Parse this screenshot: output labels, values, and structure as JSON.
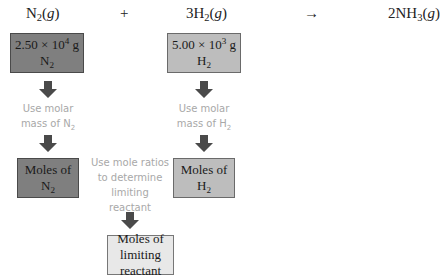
{
  "equation": {
    "reactant1": {
      "coef": "",
      "formula": "N",
      "sub": "2",
      "state": "g"
    },
    "plus": "+",
    "reactant2": {
      "coef": "3",
      "formula": "H",
      "sub": "2",
      "state": "g"
    },
    "arrow": "→",
    "product": {
      "coef": "2",
      "formula": "NH",
      "sub": "3",
      "state": "g"
    }
  },
  "boxes": {
    "n2_mass": {
      "mantissa": "2.50 × 10",
      "exp": "4",
      "unit": " g",
      "species": "N",
      "species_sub": "2",
      "color": "#7f7f7f"
    },
    "h2_mass": {
      "mantissa": "5.00 × 10",
      "exp": "3",
      "unit": " g",
      "species": "H",
      "species_sub": "2",
      "color": "#bdbdbd"
    },
    "n2_moles": {
      "line1": "Moles of",
      "species": "N",
      "species_sub": "2",
      "color": "#7f7f7f"
    },
    "h2_moles": {
      "line1": "Moles of",
      "species": "H",
      "species_sub": "2",
      "color": "#bdbdbd"
    },
    "limiting": {
      "line1": "Moles of",
      "line2": "limiting reactant",
      "color": "#e8e8e8"
    }
  },
  "notes": {
    "n2_molar": {
      "line1": "Use molar",
      "line2": "mass of N",
      "sub": "2"
    },
    "h2_molar": {
      "line1": "Use molar",
      "line2": "mass of H",
      "sub": "2"
    },
    "mole_ratio": {
      "line1": "Use mole ratios",
      "line2": "to determine",
      "line3": "limiting",
      "line4": "reactant"
    }
  },
  "icons": {
    "arrow": "down-arrow-icon",
    "arrow_color": "#4a4a4a"
  }
}
